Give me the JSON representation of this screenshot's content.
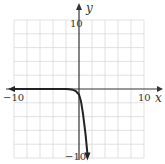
{
  "chart_data": {
    "type": "line",
    "title": "",
    "xlabel": "x",
    "ylabel": "y",
    "xlim": [
      -10,
      10
    ],
    "ylim": [
      -10,
      10
    ],
    "grid": true,
    "grid_step": 2,
    "tick_labels": {
      "x": [
        "-10",
        "10"
      ],
      "y": [
        "10",
        "-10"
      ]
    },
    "series": [
      {
        "name": "curve",
        "x": [
          -10,
          -6,
          -3,
          -2,
          -1.5,
          -1,
          -0.5,
          0,
          0.3,
          0.6,
          1.0,
          1.3
        ],
        "y": [
          0,
          0,
          0,
          0,
          -0.05,
          -0.1,
          -0.3,
          -0.8,
          -1.8,
          -3.5,
          -6.5,
          -9.5
        ],
        "left_arrow": true,
        "down_arrow": true
      }
    ]
  },
  "labels": {
    "x_axis": "x",
    "y_axis": "y",
    "x_min": "−10",
    "x_max": "10",
    "y_max": "10",
    "y_min": "−10"
  }
}
